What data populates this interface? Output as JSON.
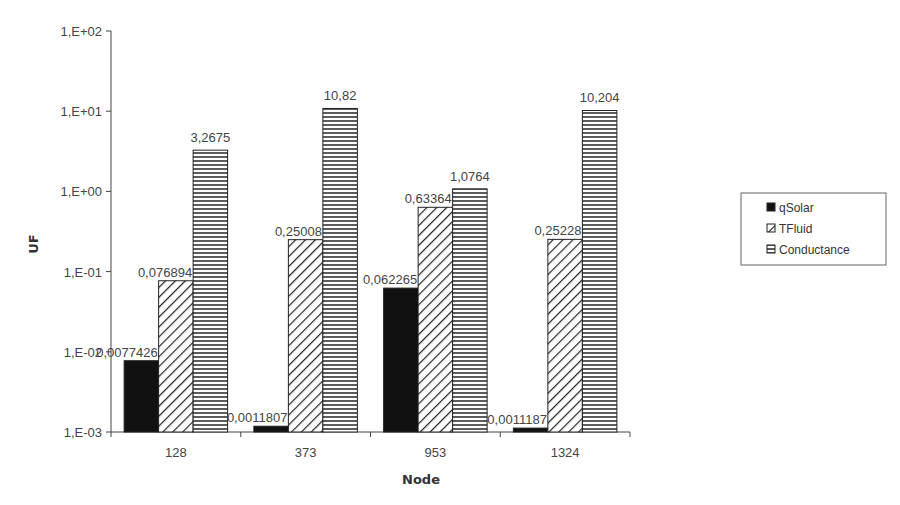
{
  "chart_data": {
    "type": "bar",
    "title": "",
    "xlabel": "Node",
    "ylabel": "UF",
    "yscale": "log",
    "ylim": [
      0.001,
      100
    ],
    "ytick_labels": [
      "1,E-03",
      "1,E-02",
      "1,E-01",
      "1,E+00",
      "1,E+01",
      "1,E+02"
    ],
    "categories": [
      "128",
      "373",
      "953",
      "1324"
    ],
    "series": [
      {
        "name": "qSolar",
        "pattern": "solid-black",
        "values": [
          0.0077426,
          0.0011807,
          0.062265,
          0.0011187
        ],
        "labels": [
          "0,0077426",
          "0,0011807",
          "0,062265",
          "0,0011187"
        ]
      },
      {
        "name": "TFluid",
        "pattern": "diagonal-hatch",
        "values": [
          0.076894,
          0.25008,
          0.63364,
          0.25228
        ],
        "labels": [
          "0,076894",
          "0,25008",
          "0,63364",
          "0,25228"
        ]
      },
      {
        "name": "Conductance",
        "pattern": "horizontal-lines",
        "values": [
          3.2675,
          10.82,
          1.0764,
          10.204
        ],
        "labels": [
          "3,2675",
          "10,82",
          "1,0764",
          "10,204"
        ]
      }
    ],
    "grid": false,
    "legend_position": "right"
  },
  "legend": {
    "items": [
      "qSolar",
      "TFluid",
      "Conductance"
    ]
  }
}
